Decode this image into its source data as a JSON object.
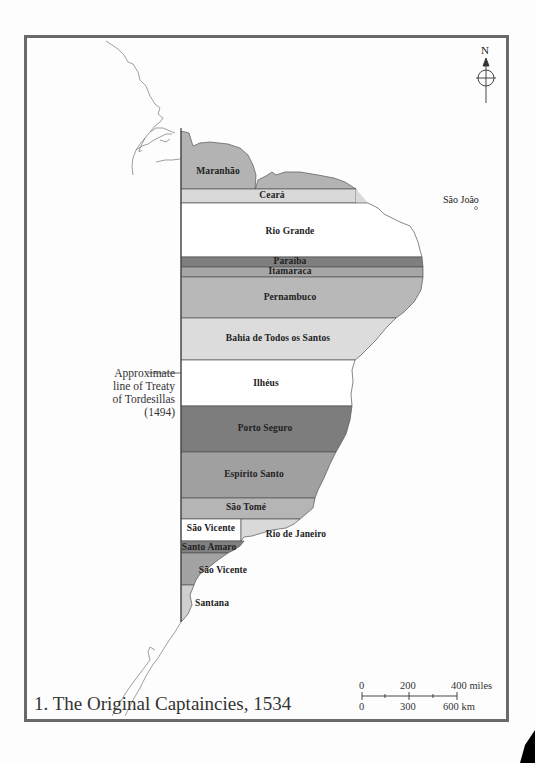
{
  "map": {
    "title": "1. The Original Captaincies, 1534",
    "north_label": "N",
    "treaty_note": {
      "lines": [
        "Approximate",
        "line of Treaty",
        "of Tordesillas",
        "(1494)"
      ]
    },
    "offshore_label": "São João",
    "captaincies": [
      {
        "name": "Maranhão",
        "fill": "#b3b3b3"
      },
      {
        "name": "Ceará",
        "fill": "#d9d9d9"
      },
      {
        "name": "Rio Grande",
        "fill": "#ffffff"
      },
      {
        "name": "Paraíba",
        "fill": "#7f7f7f"
      },
      {
        "name": "Itamaraca",
        "fill": "#a6a6a6"
      },
      {
        "name": "Pernambuco",
        "fill": "#b8b8b8"
      },
      {
        "name": "Bahia de Todos os Santos",
        "fill": "#dcdcdc"
      },
      {
        "name": "Ilhéus",
        "fill": "#ffffff"
      },
      {
        "name": "Porto Seguro",
        "fill": "#7d7d7d"
      },
      {
        "name": "Espírito Santo",
        "fill": "#a0a0a0"
      },
      {
        "name": "São Tomé",
        "fill": "#b5b5b5"
      },
      {
        "name": "São Vicente",
        "fill": "#ffffff"
      },
      {
        "name": "Rio de Janeiro",
        "fill": "#d9d9d9"
      },
      {
        "name": "Santo Amaro",
        "fill": "#808080"
      },
      {
        "name": "São Vicente",
        "fill": "#a3a3a3"
      },
      {
        "name": "Santana",
        "fill": "#cfcfcf"
      }
    ],
    "scale": {
      "miles": [
        "0",
        "200",
        "400 miles"
      ],
      "km": [
        "0",
        "300",
        "600 km"
      ]
    },
    "colors": {
      "frame": "#6a6a6a",
      "outline": "#555555",
      "background": "#ffffff"
    }
  }
}
